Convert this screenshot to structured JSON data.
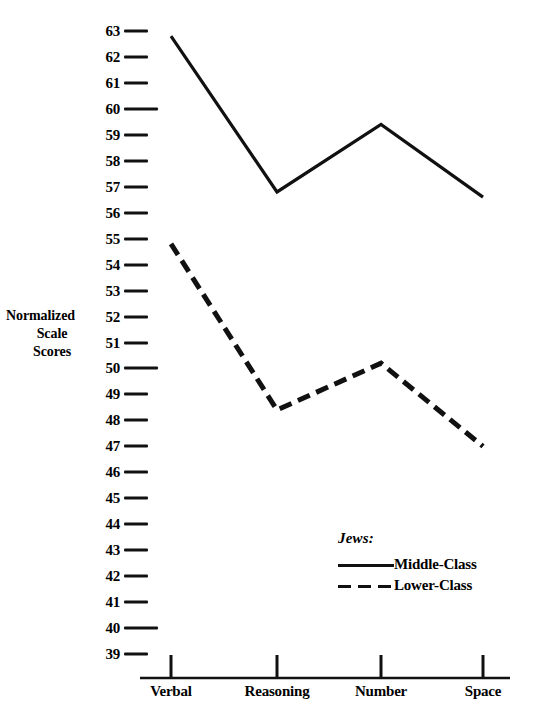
{
  "chart_data": {
    "type": "line",
    "title": "",
    "xlabel": "",
    "ylabel": "Normalized Scale Scores",
    "ylabel_lines": [
      "Normalized",
      "Scale",
      "Scores"
    ],
    "categories": [
      "Verbal",
      "Reasoning",
      "Number",
      "Space"
    ],
    "ylim": [
      39,
      63
    ],
    "grid": false,
    "legend_position": "inside-lower-right",
    "legend_title": "Jews:",
    "y_ticks": [
      {
        "value": 63,
        "label": "63",
        "major": false
      },
      {
        "value": 62,
        "label": "62",
        "major": false
      },
      {
        "value": 61,
        "label": "61",
        "major": false
      },
      {
        "value": 60,
        "label": "60",
        "major": true
      },
      {
        "value": 59,
        "label": "59",
        "major": false
      },
      {
        "value": 58,
        "label": "58",
        "major": false
      },
      {
        "value": 57,
        "label": "57",
        "major": false
      },
      {
        "value": 56,
        "label": "56",
        "major": false
      },
      {
        "value": 55,
        "label": "55",
        "major": false
      },
      {
        "value": 54,
        "label": "54",
        "major": false
      },
      {
        "value": 53,
        "label": "53",
        "major": false
      },
      {
        "value": 52,
        "label": "52",
        "major": false
      },
      {
        "value": 51,
        "label": "51",
        "major": false
      },
      {
        "value": 50,
        "label": "50",
        "major": true
      },
      {
        "value": 49,
        "label": "49",
        "major": false
      },
      {
        "value": 48,
        "label": "48",
        "major": false
      },
      {
        "value": 47,
        "label": "47",
        "major": false
      },
      {
        "value": 46,
        "label": "46",
        "major": false
      },
      {
        "value": 45,
        "label": "45",
        "major": false
      },
      {
        "value": 44,
        "label": "44",
        "major": false
      },
      {
        "value": 43,
        "label": "43",
        "major": false
      },
      {
        "value": 42,
        "label": "42",
        "major": false
      },
      {
        "value": 41,
        "label": "41",
        "major": false
      },
      {
        "value": 40,
        "label": "40",
        "major": true
      },
      {
        "value": 39,
        "label": "39",
        "major": false
      }
    ],
    "series": [
      {
        "name": "Middle-Class",
        "style": "solid",
        "color": "#111111",
        "values": [
          62.8,
          56.8,
          59.4,
          56.6
        ]
      },
      {
        "name": "Lower-Class",
        "style": "dashed",
        "color": "#111111",
        "values": [
          54.8,
          48.4,
          50.2,
          47.0
        ]
      }
    ]
  },
  "colors": {
    "ink": "#111111",
    "background": "#ffffff"
  }
}
